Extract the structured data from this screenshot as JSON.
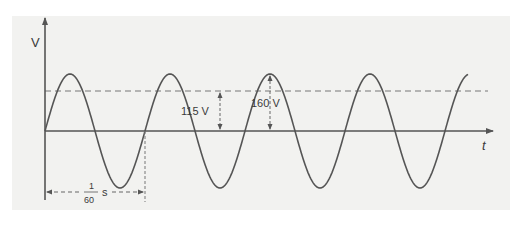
{
  "diagram": {
    "y_axis_label": "V",
    "x_axis_label": "t",
    "peak_label": "160 V",
    "rms_label": "115 V",
    "period_label": {
      "numerator": "1",
      "denominator": "60",
      "unit": "s"
    },
    "colors": {
      "background": "#f2f2f0",
      "wave": "#555555",
      "axis": "#555555",
      "dashed": "#777777",
      "text": "#3a3a3a"
    }
  },
  "chart_data": {
    "type": "line",
    "title": "",
    "xlabel": "t",
    "ylabel": "V",
    "series": [
      {
        "name": "voltage",
        "function": "160*sin(2*pi*60*t)",
        "peak": 160,
        "rms": 115,
        "frequency_hz": 60,
        "period_s": "1/60",
        "cycles_shown": 4.25
      }
    ],
    "annotations": [
      {
        "text": "160 V",
        "type": "double-arrow",
        "from": 0,
        "to": 160
      },
      {
        "text": "115 V",
        "type": "double-arrow",
        "from": 0,
        "to": 115
      },
      {
        "text": "1/60 s",
        "type": "double-arrow-horizontal",
        "from_t": 0,
        "to_t": "1/60"
      }
    ],
    "reference_lines": [
      {
        "y": 115,
        "style": "dashed",
        "label": "rms"
      }
    ],
    "grid": false
  }
}
